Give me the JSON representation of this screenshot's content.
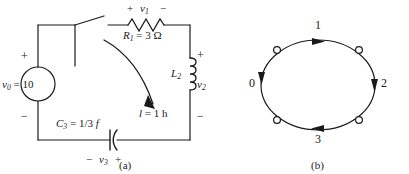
{
  "figure": {
    "background_color": "#ffffff",
    "ink_color": "#1a1a1a"
  },
  "circuit": {
    "caption": "(a)",
    "source": {
      "label": "v0 = 10",
      "label_text": "v",
      "label_sub": "0",
      "label_rest": " = 10",
      "plus_sign": "+",
      "minus_sign": "−",
      "symbol": "voltage-source-circle"
    },
    "resistor": {
      "label_text": "R",
      "label_sub": "1",
      "label_rest": " = 3 Ω",
      "polarity_plus": "+",
      "polarity_minus": "−",
      "voltage_text": "v",
      "voltage_sub": "1",
      "symbol": "resistor-zigzag"
    },
    "inductor": {
      "label_text": "L",
      "label_sub": "2",
      "value_text": "l",
      "value_rest": " = 1 h",
      "polarity_plus": "+",
      "polarity_minus": "−",
      "voltage_text": "v",
      "voltage_sub": "2",
      "symbol": "inductor-coil"
    },
    "capacitor": {
      "label_text": "C",
      "label_sub": "3",
      "label_rest": " = 1/3 ",
      "label_unit": "f",
      "polarity_minus": "−",
      "polarity_plus": "+",
      "voltage_text": "v",
      "voltage_sub": "3",
      "symbol": "capacitor-curved-plate"
    },
    "switch": {
      "symbol": "open-switch"
    },
    "current_arrow": {
      "symbol": "curved-current-arrow"
    }
  },
  "graph": {
    "caption": "(b)",
    "shape": "ellipse",
    "edge_labels": [
      "0",
      "1",
      "2",
      "3"
    ],
    "nodes": [
      {
        "position": "upper-left",
        "symbol": "hollow-circle-node"
      },
      {
        "position": "upper-right",
        "symbol": "hollow-circle-node"
      },
      {
        "position": "lower-right",
        "symbol": "hollow-circle-node"
      },
      {
        "position": "lower-left",
        "symbol": "hollow-circle-node"
      }
    ],
    "arrows": [
      {
        "label": "0",
        "position": "left",
        "direction": "down"
      },
      {
        "label": "1",
        "position": "top",
        "direction": "right"
      },
      {
        "label": "2",
        "position": "right",
        "direction": "down"
      },
      {
        "label": "3",
        "position": "bottom",
        "direction": "left"
      }
    ]
  }
}
